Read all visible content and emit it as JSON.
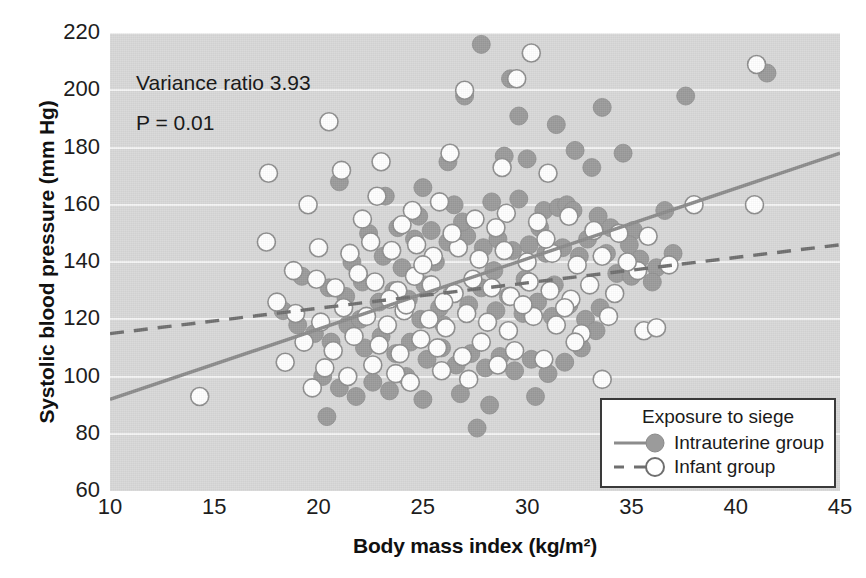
{
  "chart_data": {
    "type": "scatter",
    "title": "",
    "xlabel": "Body mass index (kg/m²)",
    "ylabel": "Systolic blood pressure (mm Hg)",
    "xlim": [
      10,
      45
    ],
    "ylim": [
      60,
      220
    ],
    "xticks": [
      10,
      15,
      20,
      25,
      30,
      35,
      40,
      45
    ],
    "yticks": [
      60,
      80,
      100,
      120,
      140,
      160,
      180,
      200,
      220
    ],
    "grid": "horizontal",
    "legend_position": "bottom-right",
    "plot_background": "#d8d8d8",
    "annotations": [
      "Variance ratio 3.93",
      "P = 0.01"
    ],
    "legend": {
      "title": "Exposure to siege",
      "entries": [
        {
          "name": "Intrauterine group",
          "marker": "filled-circle",
          "line": "solid",
          "color": "#9b9b9b",
          "line_color": "#8c8c8c"
        },
        {
          "name": "Infant group",
          "marker": "open-circle",
          "line": "dashed",
          "color": "#ffffff",
          "line_color": "#6f6f6f"
        }
      ]
    },
    "series": [
      {
        "name": "Intrauterine group",
        "marker": "filled-circle",
        "color": "#9b9b9b",
        "trendline": {
          "style": "solid",
          "color": "#8c8c8c",
          "x": [
            10,
            45
          ],
          "y": [
            92,
            178
          ]
        },
        "points": [
          [
            27.8,
            216
          ],
          [
            29.2,
            204
          ],
          [
            29.6,
            191
          ],
          [
            31.4,
            188
          ],
          [
            27.0,
            198
          ],
          [
            33.6,
            194
          ],
          [
            41.5,
            206
          ],
          [
            37.6,
            198
          ],
          [
            26.2,
            175
          ],
          [
            28.9,
            177
          ],
          [
            30.0,
            176
          ],
          [
            32.3,
            179
          ],
          [
            33.1,
            173
          ],
          [
            34.6,
            178
          ],
          [
            21.0,
            168
          ],
          [
            23.2,
            163
          ],
          [
            25.0,
            166
          ],
          [
            26.5,
            160
          ],
          [
            28.3,
            161
          ],
          [
            29.6,
            162
          ],
          [
            30.8,
            158
          ],
          [
            31.5,
            159
          ],
          [
            31.9,
            160
          ],
          [
            32.2,
            158
          ],
          [
            33.4,
            156
          ],
          [
            34.0,
            152
          ],
          [
            35.1,
            151
          ],
          [
            36.6,
            158
          ],
          [
            22.4,
            150
          ],
          [
            23.8,
            152
          ],
          [
            24.6,
            148
          ],
          [
            25.4,
            151
          ],
          [
            26.2,
            147
          ],
          [
            27.1,
            149
          ],
          [
            27.9,
            145
          ],
          [
            28.6,
            148
          ],
          [
            29.3,
            144
          ],
          [
            30.1,
            146
          ],
          [
            30.9,
            143
          ],
          [
            31.7,
            145
          ],
          [
            32.5,
            142
          ],
          [
            33.8,
            143
          ],
          [
            35.4,
            141
          ],
          [
            36.2,
            138
          ],
          [
            19.2,
            135
          ],
          [
            20.5,
            131
          ],
          [
            21.3,
            128
          ],
          [
            22.1,
            133
          ],
          [
            22.9,
            126
          ],
          [
            23.6,
            130
          ],
          [
            24.3,
            127
          ],
          [
            25.1,
            132
          ],
          [
            25.8,
            124
          ],
          [
            26.4,
            129
          ],
          [
            27.2,
            125
          ],
          [
            27.8,
            131
          ],
          [
            28.5,
            123
          ],
          [
            29.1,
            128
          ],
          [
            29.8,
            122
          ],
          [
            30.5,
            126
          ],
          [
            31.2,
            121
          ],
          [
            32.0,
            125
          ],
          [
            32.8,
            120
          ],
          [
            33.5,
            124
          ],
          [
            34.3,
            136
          ],
          [
            35.0,
            135
          ],
          [
            36.0,
            133
          ],
          [
            18.3,
            123
          ],
          [
            19.0,
            118
          ],
          [
            19.8,
            115
          ],
          [
            20.6,
            112
          ],
          [
            21.4,
            118
          ],
          [
            22.2,
            110
          ],
          [
            23.0,
            114
          ],
          [
            23.7,
            108
          ],
          [
            24.4,
            112
          ],
          [
            25.2,
            106
          ],
          [
            25.9,
            110
          ],
          [
            26.6,
            104
          ],
          [
            27.3,
            108
          ],
          [
            28.0,
            103
          ],
          [
            28.7,
            107
          ],
          [
            29.4,
            102
          ],
          [
            30.2,
            106
          ],
          [
            31.0,
            101
          ],
          [
            31.8,
            105
          ],
          [
            32.6,
            110
          ],
          [
            33.3,
            116
          ],
          [
            20.2,
            100
          ],
          [
            21.0,
            96
          ],
          [
            21.8,
            93
          ],
          [
            22.6,
            98
          ],
          [
            23.4,
            95
          ],
          [
            24.2,
            100
          ],
          [
            25.0,
            92
          ],
          [
            26.8,
            94
          ],
          [
            28.2,
            90
          ],
          [
            30.4,
            93
          ],
          [
            27.6,
            82
          ],
          [
            20.4,
            86
          ],
          [
            24.9,
            120
          ],
          [
            26.0,
            118
          ],
          [
            22.0,
            120
          ],
          [
            24.0,
            138
          ],
          [
            25.6,
            140
          ],
          [
            28.4,
            137
          ],
          [
            29.9,
            134
          ],
          [
            31.3,
            132
          ],
          [
            24.8,
            156
          ],
          [
            26.9,
            154
          ],
          [
            23.1,
            142
          ],
          [
            21.6,
            140
          ],
          [
            30.6,
            152
          ],
          [
            32.9,
            148
          ],
          [
            34.9,
            146
          ],
          [
            37.0,
            143
          ]
        ]
      },
      {
        "name": "Infant group",
        "marker": "open-circle",
        "color": "#ffffff",
        "trendline": {
          "style": "dashed",
          "color": "#6f6f6f",
          "x": [
            10,
            45
          ],
          "y": [
            115,
            146
          ]
        },
        "points": [
          [
            30.2,
            213
          ],
          [
            27.0,
            200
          ],
          [
            20.5,
            189
          ],
          [
            29.5,
            204
          ],
          [
            41.0,
            209
          ],
          [
            17.6,
            171
          ],
          [
            21.1,
            172
          ],
          [
            23.0,
            175
          ],
          [
            26.3,
            178
          ],
          [
            28.8,
            173
          ],
          [
            31.0,
            171
          ],
          [
            38.0,
            160
          ],
          [
            40.9,
            160
          ],
          [
            17.5,
            147
          ],
          [
            19.5,
            160
          ],
          [
            22.8,
            163
          ],
          [
            24.5,
            158
          ],
          [
            25.8,
            161
          ],
          [
            27.5,
            155
          ],
          [
            29.0,
            157
          ],
          [
            30.5,
            154
          ],
          [
            32.0,
            156
          ],
          [
            33.2,
            151
          ],
          [
            34.4,
            150
          ],
          [
            35.8,
            149
          ],
          [
            20.0,
            145
          ],
          [
            21.5,
            143
          ],
          [
            22.5,
            147
          ],
          [
            23.5,
            144
          ],
          [
            24.7,
            146
          ],
          [
            25.5,
            142
          ],
          [
            26.7,
            145
          ],
          [
            27.7,
            141
          ],
          [
            28.9,
            144
          ],
          [
            30.0,
            140
          ],
          [
            31.2,
            143
          ],
          [
            32.4,
            139
          ],
          [
            33.6,
            142
          ],
          [
            18.8,
            137
          ],
          [
            19.9,
            134
          ],
          [
            20.8,
            131
          ],
          [
            21.9,
            136
          ],
          [
            22.7,
            133
          ],
          [
            23.8,
            130
          ],
          [
            24.6,
            135
          ],
          [
            25.4,
            132
          ],
          [
            26.5,
            129
          ],
          [
            27.4,
            134
          ],
          [
            28.3,
            131
          ],
          [
            29.2,
            128
          ],
          [
            30.1,
            133
          ],
          [
            31.1,
            130
          ],
          [
            32.1,
            127
          ],
          [
            33.0,
            132
          ],
          [
            34.2,
            129
          ],
          [
            35.3,
            137
          ],
          [
            18.0,
            126
          ],
          [
            18.9,
            122
          ],
          [
            20.1,
            119
          ],
          [
            21.2,
            124
          ],
          [
            22.3,
            121
          ],
          [
            23.3,
            118
          ],
          [
            24.1,
            123
          ],
          [
            25.3,
            120
          ],
          [
            26.1,
            117
          ],
          [
            27.1,
            122
          ],
          [
            28.1,
            119
          ],
          [
            29.1,
            116
          ],
          [
            30.3,
            121
          ],
          [
            31.4,
            118
          ],
          [
            32.6,
            115
          ],
          [
            33.9,
            121
          ],
          [
            35.6,
            116
          ],
          [
            36.2,
            117
          ],
          [
            19.3,
            112
          ],
          [
            20.7,
            109
          ],
          [
            21.7,
            114
          ],
          [
            22.9,
            111
          ],
          [
            23.9,
            108
          ],
          [
            24.9,
            113
          ],
          [
            25.7,
            110
          ],
          [
            26.9,
            107
          ],
          [
            27.8,
            112
          ],
          [
            29.4,
            109
          ],
          [
            30.8,
            106
          ],
          [
            32.3,
            112
          ],
          [
            18.4,
            105
          ],
          [
            20.3,
            103
          ],
          [
            21.4,
            100
          ],
          [
            22.6,
            104
          ],
          [
            23.7,
            101
          ],
          [
            24.4,
            98
          ],
          [
            25.9,
            102
          ],
          [
            27.2,
            99
          ],
          [
            28.6,
            104
          ],
          [
            33.6,
            99
          ],
          [
            14.3,
            93
          ],
          [
            19.7,
            96
          ],
          [
            23.4,
            127
          ],
          [
            24.2,
            125
          ],
          [
            26.0,
            126
          ],
          [
            29.8,
            125
          ],
          [
            31.8,
            124
          ],
          [
            25.0,
            139
          ],
          [
            28.5,
            152
          ],
          [
            30.9,
            148
          ],
          [
            34.8,
            140
          ],
          [
            36.8,
            139
          ],
          [
            22.1,
            155
          ],
          [
            24.0,
            153
          ],
          [
            26.4,
            150
          ]
        ]
      }
    ]
  }
}
